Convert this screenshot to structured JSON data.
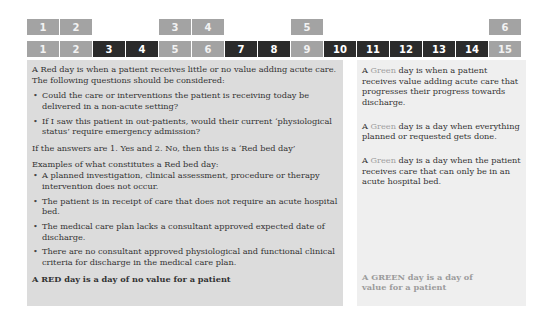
{
  "top_row": [
    {
      "label": "1",
      "style": "gray"
    },
    {
      "label": "2",
      "style": "gray"
    },
    {
      "label": "",
      "style": "empty"
    },
    {
      "label": "",
      "style": "empty"
    },
    {
      "label": "3",
      "style": "gray"
    },
    {
      "label": "4",
      "style": "gray"
    },
    {
      "label": "",
      "style": "empty"
    },
    {
      "label": "",
      "style": "empty"
    },
    {
      "label": "5",
      "style": "gray"
    },
    {
      "label": "",
      "style": "empty"
    },
    {
      "label": "",
      "style": "empty"
    },
    {
      "label": "",
      "style": "empty"
    },
    {
      "label": "",
      "style": "empty"
    },
    {
      "label": "",
      "style": "empty"
    },
    {
      "label": "6",
      "style": "gray"
    }
  ],
  "day_row": [
    {
      "label": "1",
      "style": "gray"
    },
    {
      "label": "2",
      "style": "gray"
    },
    {
      "label": "3",
      "style": "dark"
    },
    {
      "label": "4",
      "style": "dark"
    },
    {
      "label": "5",
      "style": "gray"
    },
    {
      "label": "6",
      "style": "gray"
    },
    {
      "label": "7",
      "style": "dark"
    },
    {
      "label": "8",
      "style": "dark"
    },
    {
      "label": "9",
      "style": "gray"
    },
    {
      "label": "10",
      "style": "dark"
    },
    {
      "label": "11",
      "style": "dark"
    },
    {
      "label": "12",
      "style": "dark"
    },
    {
      "label": "13",
      "style": "dark"
    },
    {
      "label": "14",
      "style": "dark"
    },
    {
      "label": "15",
      "style": "gray"
    }
  ],
  "red_panel": {
    "intro": "A Red day is when a patient receives little or no value adding acute care. The following questions should be considered:",
    "questions": [
      "Could the care or interventions the patient is receiving today be delivered in a non-acute setting?",
      "If I saw this patient in out-patients, would their current ‘physiological status’ require emergency admission?"
    ],
    "conclusion": "If the answers are 1. Yes and 2. No, then this is a ‘Red bed day’",
    "examples_heading": "Examples of what constitutes a Red bed day:",
    "examples": [
      "A planned investigation, clinical assessment, procedure or therapy intervention does not occur.",
      "The patient is in receipt of care that does not require an acute hospital bed.",
      "The medical care plan lacks a consultant approved expected date of discharge.",
      "There are no consultant approved physiological and functional clinical criteria for discharge in the medical care plan."
    ],
    "footer": "A RED day is a day of no value for a patient"
  },
  "green_panel": {
    "paragraphs": [
      {
        "prefix": "A ",
        "highlight": "Green",
        "rest": " day is when a patient receives value adding acute care that progresses their progress towards discharge."
      },
      {
        "prefix": "A ",
        "highlight": "Green",
        "rest": " day is a day when everything planned or requested gets done."
      },
      {
        "prefix": "A ",
        "highlight": "Green",
        "rest": " day is a day when the patient receives care that can only be in an acute hospital bed."
      }
    ],
    "footer": "A GREEN day is a day of value for a patient"
  },
  "colors": {
    "gray_cell": "#a3a3a3",
    "dark_cell": "#2b2b2b",
    "red_panel_bg": "#dcdcdc",
    "green_panel_bg": "#efefef"
  }
}
